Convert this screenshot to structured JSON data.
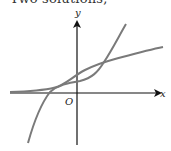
{
  "caption": "Two solutions;",
  "graph": {
    "x_axis_label": "x",
    "y_axis_label": "y",
    "origin_label": "O",
    "axis_color": "#111111",
    "curve_color": "#7a7a7a",
    "curves": [
      {
        "name": "flat-rising-curve",
        "description": "approaches x-axis on the left, rises slowly to the right"
      },
      {
        "name": "steep-cubic-curve",
        "description": "steep curve rising from lower-left to upper-right"
      }
    ],
    "intersections": 2
  }
}
